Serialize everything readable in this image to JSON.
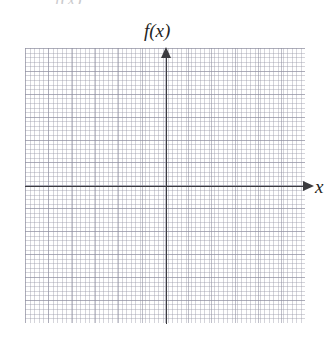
{
  "figure": {
    "name": "blank-cartesian-grid",
    "clipped_text_above": "f(x)",
    "axes": {
      "y_axis_label": "f(x)",
      "x_axis_label": "x"
    }
  },
  "chart_data": {
    "type": "line",
    "title": "",
    "subtitle": "",
    "xlabel": "x",
    "ylabel": "f(x)",
    "series": [],
    "categories": [],
    "x": [],
    "values": [],
    "annotations": [],
    "legend": [],
    "legend_position": "none",
    "grid": true,
    "grid_style": "dotted-graph-paper",
    "grid_major_cells_x": 12,
    "grid_major_cells_y": 12,
    "grid_minor_per_major": 5,
    "origin_major_cell_x": 6,
    "origin_major_cell_y": 6,
    "xlim": [
      -6,
      6
    ],
    "ylim": [
      -6,
      6
    ],
    "xtick_labels": [],
    "ytick_labels": [],
    "x_axis_arrow": true,
    "y_axis_arrow": true,
    "axis_color": "#3b3b3f",
    "grid_color": "#8c8c9e",
    "background_color": "#ffffff",
    "note": "Empty coordinate plane; no data plotted."
  }
}
